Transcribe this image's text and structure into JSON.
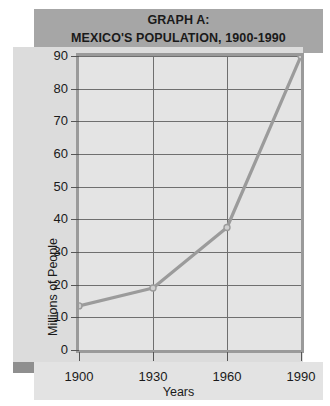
{
  "title": {
    "line1": "GRAPH A:",
    "line2": "MEXICO'S POPULATION, 1900-1990"
  },
  "colors": {
    "header_band": "#a6a6a6",
    "main_panel": "#dcdcdc",
    "plot_background": "#e4e4e4",
    "plot_border": "#9a9a9a",
    "shadow_band": "#8f8f8f",
    "xlabel_strip": "#e3e3e3",
    "line": "#9b9b9b",
    "gridline": "#6f6f6f",
    "text": "#1a1a1a"
  },
  "chart_data": {
    "type": "line",
    "title": "GRAPH A: MEXICO'S POPULATION, 1900-1990",
    "xlabel": "Years",
    "ylabel": "Millions of People",
    "x": [
      1900,
      1930,
      1960,
      1990
    ],
    "values": [
      13.5,
      19,
      37.5,
      90
    ],
    "series": [
      {
        "name": "Mexico's Population",
        "values": [
          13.5,
          19,
          37.5,
          90
        ]
      }
    ],
    "xticks": [
      "1900",
      "1930",
      "1960",
      "1990"
    ],
    "yticks": [
      "0",
      "10",
      "20",
      "30",
      "40",
      "50",
      "60",
      "70",
      "80",
      "90"
    ],
    "xlim": [
      1900,
      1990
    ],
    "ylim": [
      0,
      90
    ],
    "grid": true,
    "legend": "none",
    "markers": true
  }
}
